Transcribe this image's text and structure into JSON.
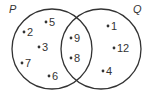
{
  "diagram": {
    "type": "venn",
    "sets": [
      {
        "name": "P",
        "cx": 52,
        "cy": 49,
        "r": 40,
        "label_x": 10,
        "label_y": 12
      },
      {
        "name": "Q",
        "cx": 101,
        "cy": 49,
        "r": 40,
        "label_x": 134,
        "label_y": 12
      }
    ],
    "only_P": [
      {
        "value": "5",
        "x": 49,
        "y": 24
      },
      {
        "value": "2",
        "x": 27,
        "y": 34
      },
      {
        "value": "3",
        "x": 42,
        "y": 49
      },
      {
        "value": "7",
        "x": 25,
        "y": 65
      },
      {
        "value": "6",
        "x": 52,
        "y": 78
      }
    ],
    "P_and_Q": [
      {
        "value": "9",
        "x": 72,
        "y": 40
      },
      {
        "value": "8",
        "x": 72,
        "y": 60
      }
    ],
    "only_Q": [
      {
        "value": "1",
        "x": 107,
        "y": 27
      },
      {
        "value": "12",
        "x": 116,
        "y": 49
      },
      {
        "value": "4",
        "x": 103,
        "y": 72
      }
    ],
    "colors": {
      "stroke": "#333333",
      "text": "#333333",
      "background": "#ffffff"
    }
  }
}
